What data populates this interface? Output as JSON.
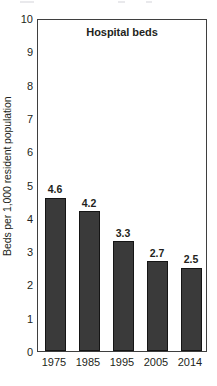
{
  "chart_data": {
    "type": "bar",
    "title": "Hospital beds",
    "xlabel": "",
    "ylabel": "Beds per 1,000 resident population",
    "categories": [
      "1975",
      "1985",
      "1995",
      "2005",
      "2014"
    ],
    "values": [
      4.6,
      4.2,
      3.3,
      2.7,
      2.5
    ],
    "value_labels": [
      "4.6",
      "4.2",
      "3.3",
      "2.7",
      "2.5"
    ],
    "ylim": [
      0,
      10
    ],
    "yticks": [
      0,
      1,
      2,
      3,
      4,
      5,
      6,
      7,
      8,
      9,
      10
    ],
    "ytick_labels": [
      "0",
      "1",
      "2",
      "3",
      "4",
      "5",
      "6",
      "7",
      "8",
      "9",
      "10"
    ],
    "grid": false,
    "legend": false,
    "bar_color": "#3a3a3a",
    "frame_color": "#3f3f3f",
    "text_color": "#231f20"
  }
}
